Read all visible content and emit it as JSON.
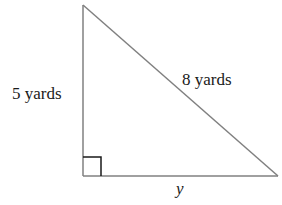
{
  "diagram": {
    "type": "right-triangle",
    "colors": {
      "stroke": "#808080",
      "right_angle_marker": "#1a1a1a",
      "text": "#1a1a1a"
    },
    "vertices": {
      "top": [
        83,
        5
      ],
      "right_angle": [
        83,
        176
      ],
      "right": [
        278,
        176
      ]
    },
    "labels": {
      "vertical_leg": "5 yards",
      "hypotenuse": "8 yards",
      "horizontal_leg": "y"
    }
  }
}
